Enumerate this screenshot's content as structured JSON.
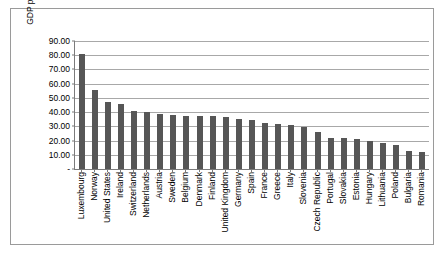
{
  "chart_data": {
    "type": "bar",
    "title": "",
    "xlabel": "",
    "ylabel": "GDP per capita – (PPP), $",
    "ylim": [
      0,
      90
    ],
    "ytick_labels": [
      "90.00",
      "80.00",
      "70.00",
      "60.00",
      "50.00",
      "40.00",
      "30.00",
      "20.00",
      "10.00",
      "-"
    ],
    "ytick_values": [
      90,
      80,
      70,
      60,
      50,
      40,
      30,
      20,
      10,
      0
    ],
    "grid": true,
    "legend": "none",
    "bar_color": "#565656",
    "categories": [
      "Luxembourg",
      "Norway",
      "United States",
      "Ireland",
      "Switzerland",
      "Netherlands",
      "Austria",
      "Sweden",
      "Belgium",
      "Denmark",
      "Finland",
      "United Kingdom",
      "Germany",
      "Spain",
      "France",
      "Greece",
      "Italy",
      "Slovenia",
      "Czech Republic",
      "Portugal",
      "Slovakia",
      "Estonia",
      "Hungary",
      "Lithuania",
      "Poland",
      "Bulgaria",
      "Romania"
    ],
    "values": [
      81.0,
      55.5,
      46.8,
      45.8,
      40.5,
      40.0,
      39.0,
      38.2,
      37.0,
      37.3,
      37.0,
      36.3,
      35.0,
      34.6,
      32.4,
      31.5,
      31.0,
      29.3,
      25.8,
      22.0,
      21.7,
      21.2,
      19.6,
      18.0,
      17.0,
      12.6,
      12.2
    ]
  }
}
